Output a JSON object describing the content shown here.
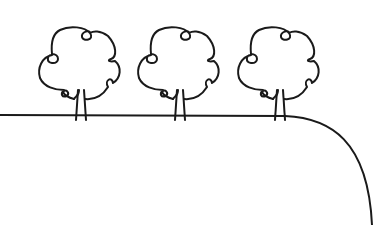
{
  "illustration": {
    "subject": "three trees on a horizon line curving downward at right",
    "colors": {
      "background": "#ffffff",
      "line": "#1a1a1a"
    },
    "trees": [
      {
        "name": "tree-1",
        "offset_x": 0
      },
      {
        "name": "tree-2",
        "offset_x": 99
      },
      {
        "name": "tree-3",
        "offset_x": 199
      }
    ]
  }
}
